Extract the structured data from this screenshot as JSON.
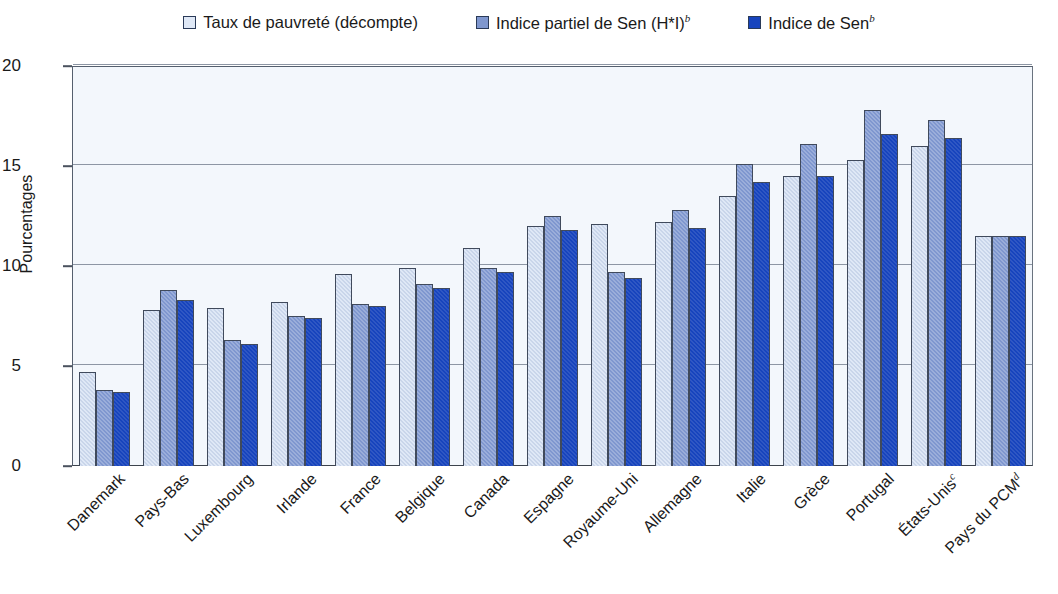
{
  "chart_data": {
    "type": "bar",
    "title": "",
    "xlabel": "",
    "ylabel": "Pourcentages",
    "ylim": [
      0,
      20
    ],
    "yticks": [
      0,
      5,
      10,
      15,
      20
    ],
    "grid": true,
    "legend_position": "top-center",
    "categories": [
      "Danemark",
      "Pays-Bas",
      "Luxembourg",
      "Irlande",
      "France",
      "Belgique",
      "Canada",
      "Espagne",
      "Royaume-Uni",
      "Allemagne",
      "Italie",
      "Grèce",
      "Portugal",
      "États-Unis",
      "Pays du PCM"
    ],
    "category_superscripts": [
      "",
      "",
      "",
      "",
      "",
      "",
      "",
      "",
      "",
      "",
      "",
      "",
      "",
      "c",
      "d"
    ],
    "series": [
      {
        "name": "Taux de pauvreté (décompte)",
        "superscript": "",
        "color": "#dfe8f6",
        "values": [
          4.7,
          7.8,
          7.9,
          8.2,
          9.6,
          9.9,
          10.9,
          12.0,
          12.1,
          12.2,
          13.5,
          14.5,
          15.3,
          16.0,
          11.5
        ]
      },
      {
        "name": "Indice partiel de Sen (H*I)",
        "superscript": "b",
        "color": "#7f97cf",
        "values": [
          3.8,
          8.8,
          6.3,
          7.5,
          8.1,
          9.1,
          9.9,
          12.5,
          9.7,
          12.8,
          15.1,
          16.1,
          17.8,
          17.3,
          11.5
        ]
      },
      {
        "name": "Indice de Sen",
        "superscript": "b",
        "color": "#1744bd",
        "values": [
          3.7,
          8.3,
          6.1,
          7.4,
          8.0,
          8.9,
          9.7,
          11.8,
          9.4,
          11.9,
          14.2,
          14.5,
          16.6,
          16.4,
          11.5
        ]
      }
    ]
  },
  "colors": {
    "series_1": "#dfe8f6",
    "series_2": "#7f97cf",
    "series_3": "#1744bd",
    "plot_background": "#f3f7fc",
    "gridline": "#8d96a4",
    "frame": "#555f6e"
  }
}
